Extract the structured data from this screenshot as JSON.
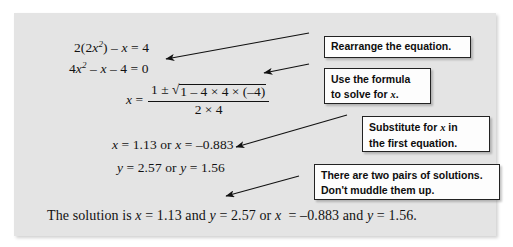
{
  "figure": {
    "type": "worked-example-diagram",
    "panel_color": "#e4e4e4",
    "callout_fill": "#fdfdfd",
    "callout_border": "#222222",
    "ink_color": "#121212"
  },
  "equations": {
    "line1": {
      "parts": [
        "2(2",
        "x",
        "2",
        ") – ",
        "x",
        " = 4"
      ],
      "plain": "2(2x²) – x = 4"
    },
    "line2": {
      "plain": "4x² – x – 4 = 0"
    },
    "formula": {
      "lhs": "x",
      "equals": "=",
      "numerator_prefix": "1 ± ",
      "radical_sign": "√",
      "radicand": "1 – 4 × 4 × (–4)",
      "denominator": "2 × 4",
      "plain": "x = [1 ± √(1 – 4 × 4 × (–4))] / (2 × 4)"
    },
    "line4": {
      "plain": "x = 1.13 or x = –0.883",
      "x1": "1.13",
      "x2": "–0.883"
    },
    "line5": {
      "plain": "y = 2.57 or y = 1.56",
      "y1": "2.57",
      "y2": "1.56"
    },
    "solution": {
      "lead": "The solution is ",
      "plain": "The solution is x = 1.13 and y = 2.57 or x = –0.883 and y = 1.56.",
      "and": " and ",
      "or": " or ",
      "period": "."
    }
  },
  "callouts": [
    {
      "id": "rearrange",
      "lines": [
        "Rearrange the equation."
      ]
    },
    {
      "id": "use-formula",
      "lines": [
        "Use the formula",
        "to solve for x."
      ],
      "line2_prefix": "to solve for ",
      "line2_var": "x",
      "line2_suffix": "."
    },
    {
      "id": "substitute",
      "lines": [
        "Substitute for x in",
        "the first equation."
      ],
      "line1_prefix": "Substitute for ",
      "line1_var": "x",
      "line1_suffix": " in"
    },
    {
      "id": "two-pairs",
      "lines": [
        "There are two pairs of solutions.",
        "Don't muddle them up."
      ]
    }
  ],
  "arrows": [
    {
      "id": "arrow-rearrange",
      "from": [
        309,
        33
      ],
      "to": [
        166,
        59
      ]
    },
    {
      "id": "arrow-use-formula",
      "from": [
        309,
        64
      ],
      "to": [
        264,
        73
      ]
    },
    {
      "id": "arrow-substitute",
      "from": [
        347,
        115
      ],
      "to": [
        236,
        147
      ]
    },
    {
      "id": "arrow-two-pairs",
      "from": [
        299,
        176
      ],
      "to": [
        226,
        196
      ]
    }
  ]
}
